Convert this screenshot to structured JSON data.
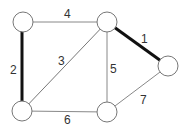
{
  "graph": {
    "nodes": [
      {
        "id": "A",
        "x": 23,
        "y": 22
      },
      {
        "id": "B",
        "x": 107,
        "y": 22
      },
      {
        "id": "C",
        "x": 168,
        "y": 66
      },
      {
        "id": "D",
        "x": 22,
        "y": 111
      },
      {
        "id": "E",
        "x": 107,
        "y": 112
      }
    ],
    "edges": [
      {
        "from": "B",
        "to": "C",
        "weight": "1",
        "bold": true
      },
      {
        "from": "A",
        "to": "D",
        "weight": "2",
        "bold": true
      },
      {
        "from": "D",
        "to": "B",
        "weight": "3",
        "bold": false
      },
      {
        "from": "A",
        "to": "B",
        "weight": "4",
        "bold": false
      },
      {
        "from": "B",
        "to": "E",
        "weight": "5",
        "bold": false
      },
      {
        "from": "D",
        "to": "E",
        "weight": "6",
        "bold": false
      },
      {
        "from": "E",
        "to": "C",
        "weight": "7",
        "bold": false
      }
    ]
  },
  "labels": {
    "e1": "1",
    "e2": "2",
    "e3": "3",
    "e4": "4",
    "e5": "5",
    "e6": "6",
    "e7": "7"
  }
}
